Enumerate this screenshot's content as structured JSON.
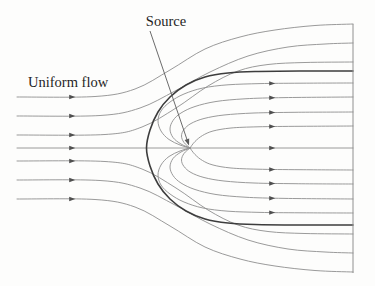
{
  "figure": {
    "labels": {
      "source": "Source",
      "uniform_flow": "Uniform flow"
    },
    "canvas": {
      "width": 375,
      "height": 286,
      "background": "#fdfdfc"
    },
    "colors": {
      "streamline": "#8f8f8f",
      "body_streamline": "#3d3d3d",
      "arrowhead": "#4f4f4f",
      "label_text": "#1f1f1f",
      "annotation": "#5a5a5a",
      "border": "#909090"
    },
    "source_point": {
      "x": 190,
      "y": 148
    },
    "stagnation_point": {
      "x": 146.5,
      "y": 148
    },
    "mirror_axis_y": 148,
    "annotation_arrow": {
      "x1": 150,
      "y1": 31,
      "x2": 188.5,
      "y2": 144
    },
    "right_border": {
      "x": 353,
      "y_top": 24,
      "y_bottom": 273
    },
    "streamlines": [
      {
        "id": "axis-streamline",
        "kind": "axis",
        "mirror": false,
        "points": [
          [
            17,
            148
          ],
          [
            353,
            148
          ]
        ],
        "arrows": [
          [
            72,
            148
          ],
          [
            272,
            148
          ]
        ]
      },
      {
        "id": "uniform-outer-1",
        "kind": "thin",
        "mirror": true,
        "points": [
          [
            17,
            97
          ],
          [
            95,
            96.5
          ],
          [
            135,
            89
          ],
          [
            170,
            70
          ],
          [
            205,
            49
          ],
          [
            240,
            37
          ],
          [
            275,
            30
          ],
          [
            315,
            25.5
          ],
          [
            353,
            24
          ]
        ],
        "arrows": [
          [
            72,
            97
          ]
        ]
      },
      {
        "id": "uniform-outer-2",
        "kind": "thin",
        "mirror": true,
        "points": [
          [
            17,
            116
          ],
          [
            100,
            115.5
          ],
          [
            140,
            108
          ],
          [
            175,
            91
          ],
          [
            210,
            72
          ],
          [
            248,
            56
          ],
          [
            288,
            47
          ],
          [
            325,
            44
          ],
          [
            353,
            43
          ]
        ],
        "arrows": [
          [
            72,
            116
          ]
        ]
      },
      {
        "id": "uniform-outer-3",
        "kind": "thin",
        "mirror": true,
        "points": [
          [
            17,
            135
          ],
          [
            105,
            134.5
          ],
          [
            142,
            127
          ],
          [
            176,
            108
          ],
          [
            208,
            86
          ],
          [
            238,
            71
          ],
          [
            268,
            64.5
          ],
          [
            305,
            62.5
          ],
          [
            353,
            62
          ]
        ],
        "arrows": [
          [
            72,
            135
          ]
        ]
      },
      {
        "id": "dividing-body-streamline",
        "kind": "body",
        "mirror": false,
        "points": [
          [
            353,
            71
          ],
          [
            300,
            71
          ],
          [
            255,
            71.5
          ],
          [
            228,
            73
          ],
          [
            205,
            77
          ],
          [
            186,
            85
          ],
          [
            170,
            97
          ],
          [
            158,
            112
          ],
          [
            150,
            130
          ],
          [
            146.5,
            148
          ],
          [
            150,
            166
          ],
          [
            158,
            184
          ],
          [
            170,
            199
          ],
          [
            186,
            211
          ],
          [
            205,
            219
          ],
          [
            228,
            223
          ],
          [
            255,
            224.5
          ],
          [
            300,
            225
          ],
          [
            353,
            225
          ]
        ],
        "arrows": []
      },
      {
        "id": "source-fan-1",
        "kind": "thin",
        "mirror": true,
        "points": [
          [
            190,
            148
          ],
          [
            180,
            145
          ],
          [
            169,
            139.5
          ],
          [
            161,
            131
          ],
          [
            158,
            121
          ],
          [
            161,
            111
          ],
          [
            170,
            102
          ],
          [
            184,
            94
          ],
          [
            203,
            88
          ],
          [
            228,
            84.8
          ],
          [
            260,
            83.6
          ],
          [
            300,
            83.2
          ],
          [
            353,
            83
          ]
        ],
        "arrows": [
          [
            272,
            83.4
          ]
        ]
      },
      {
        "id": "source-fan-2",
        "kind": "thin",
        "mirror": true,
        "points": [
          [
            190,
            148
          ],
          [
            181,
            144
          ],
          [
            173,
            137.5
          ],
          [
            170,
            129
          ],
          [
            173,
            120.5
          ],
          [
            181,
            113
          ],
          [
            195,
            106.5
          ],
          [
            216,
            101.5
          ],
          [
            245,
            98.8
          ],
          [
            285,
            97.6
          ],
          [
            353,
            97
          ]
        ],
        "arrows": [
          [
            272,
            97.8
          ]
        ]
      },
      {
        "id": "source-fan-3",
        "kind": "thin",
        "mirror": true,
        "points": [
          [
            190,
            148
          ],
          [
            184,
            142.5
          ],
          [
            181.5,
            136
          ],
          [
            184,
            129.5
          ],
          [
            191,
            123.5
          ],
          [
            204,
            118.5
          ],
          [
            224,
            115
          ],
          [
            254,
            113
          ],
          [
            295,
            112.3
          ],
          [
            353,
            112
          ]
        ],
        "arrows": [
          [
            272,
            112.5
          ]
        ]
      },
      {
        "id": "source-fan-4",
        "kind": "thin",
        "mirror": true,
        "points": [
          [
            190,
            148
          ],
          [
            195,
            141.5
          ],
          [
            202.5,
            135.5
          ],
          [
            213,
            131
          ],
          [
            231,
            128
          ],
          [
            258,
            126.8
          ],
          [
            300,
            126.3
          ],
          [
            353,
            126
          ]
        ],
        "arrows": [
          [
            272,
            126.5
          ]
        ]
      }
    ]
  }
}
